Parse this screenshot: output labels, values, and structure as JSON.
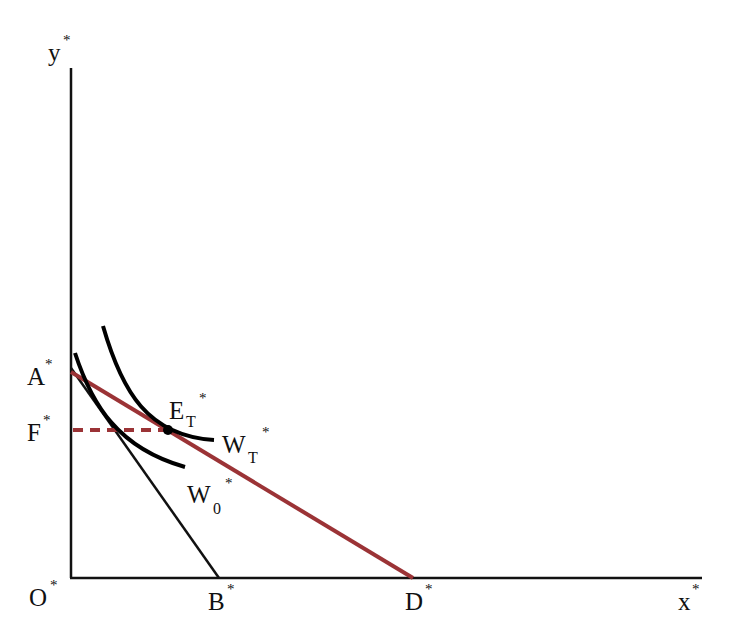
{
  "diagram": {
    "type": "economics-indifference-curve",
    "colors": {
      "axis": "#111111",
      "curve": "#000000",
      "budget_initial": "#111111",
      "budget_trade": "#9b3336",
      "dashed": "#9b3336"
    },
    "axes": {
      "y_label": "y",
      "y_sup": "*",
      "x_label": "x",
      "x_sup": "*",
      "origin_label": "O",
      "origin_sup": "*"
    },
    "points": {
      "A": {
        "label": "A",
        "sup": "*"
      },
      "F": {
        "label": "F",
        "sup": "*"
      },
      "B": {
        "label": "B",
        "sup": "*"
      },
      "D": {
        "label": "D",
        "sup": "*"
      },
      "E": {
        "label": "E",
        "sub": "T",
        "sup": "*"
      }
    },
    "curves": {
      "W0": {
        "label": "W",
        "sub": "0",
        "sup": "*"
      },
      "WT": {
        "label": "W",
        "sub": "T",
        "sup": "*"
      }
    }
  }
}
